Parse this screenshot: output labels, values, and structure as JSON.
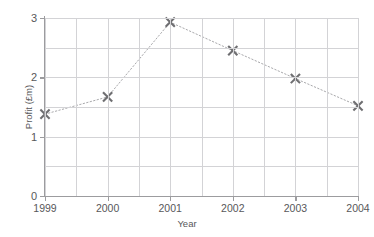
{
  "chart_data": {
    "type": "line",
    "title": "",
    "xlabel": "Year",
    "ylabel": "Profit (£m)",
    "categories": [
      "1999",
      "2000",
      "2001",
      "2002",
      "2003",
      "2004"
    ],
    "x": [
      1999,
      2000,
      2001,
      2002,
      2003,
      2004
    ],
    "values": [
      1.38,
      1.67,
      2.93,
      2.45,
      1.98,
      1.52
    ],
    "series": [
      {
        "name": "Profit",
        "values": [
          1.38,
          1.67,
          2.93,
          2.45,
          1.98,
          1.52
        ]
      }
    ],
    "xlim": [
      1999,
      2004
    ],
    "ylim": [
      0,
      3
    ],
    "y_ticks": [
      "0",
      "1",
      "2",
      "3"
    ],
    "y_tick_values": [
      0,
      1,
      2,
      3
    ],
    "y_minor_step": 0.5,
    "x_minor_step": 0.5,
    "grid": true,
    "legend": "none",
    "marker": "x-cross",
    "line_style": "dotted",
    "colors": {
      "marker": "#6e6e71",
      "line": "#a9a9ac",
      "grid": "#d3d3d6",
      "axis": "#9c9c9f",
      "text": "#58585a",
      "background": "#ffffff"
    }
  },
  "axes": {
    "y_title": "Profit (£m)",
    "x_title": "Year"
  },
  "title_strip": {
    "text": ""
  }
}
